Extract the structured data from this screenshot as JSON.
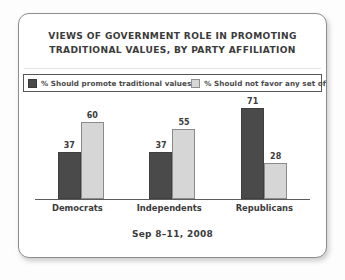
{
  "card": {
    "title_lines": [
      "VIEWS OF GOVERNMENT ROLE IN PROMOTING",
      "TRADITIONAL VALUES, BY PARTY AFFILIATION"
    ],
    "footer": "Sep 8–11, 2008"
  },
  "legend": {
    "items": [
      {
        "label": "% Should promote traditional values",
        "color": "#4a4a4a",
        "swatch": "dark"
      },
      {
        "label": "% Should not favor any set of values",
        "color": "#d6d6d6",
        "swatch": "light"
      }
    ]
  },
  "chart_data": {
    "type": "bar",
    "title": "VIEWS OF GOVERNMENT ROLE IN PROMOTING TRADITIONAL VALUES, BY PARTY AFFILIATION",
    "subtitle": "Sep 8–11, 2008",
    "xlabel": "",
    "ylabel": "",
    "ylim": [
      0,
      80
    ],
    "grid": false,
    "legend_position": "top",
    "categories": [
      "Democrats",
      "Independents",
      "Republicans"
    ],
    "series": [
      {
        "name": "% Should promote traditional values",
        "color": "#4a4a4a",
        "values": [
          37,
          37,
          71
        ]
      },
      {
        "name": "% Should not favor any set of values",
        "color": "#d6d6d6",
        "values": [
          60,
          55,
          28
        ]
      }
    ]
  }
}
